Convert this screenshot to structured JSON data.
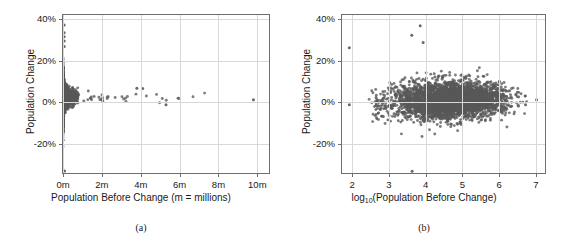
{
  "figure": {
    "panels": [
      {
        "id": "panel-a",
        "caption": "(a)",
        "xlabel": "Population Before Change (m = millions)",
        "ylabel": "Population Change",
        "xticks": [
          "0m",
          "2m",
          "4m",
          "6m",
          "8m",
          "10m"
        ],
        "yticks": [
          "40%",
          "20%",
          "0%",
          "-20%"
        ]
      },
      {
        "id": "panel-b",
        "caption": "(b)",
        "xlabel_prefix": "log",
        "xlabel_sub": "10",
        "xlabel_suffix": "(Population Before Change)",
        "ylabel": "Population Change",
        "xticks": [
          "2",
          "3",
          "4",
          "5",
          "6",
          "7"
        ],
        "yticks": [
          "40%",
          "20%",
          "0%",
          "-20%"
        ]
      }
    ]
  },
  "colors": {
    "point": "#585858",
    "frame": "#6e6e6e",
    "grid": "#d8d8d8",
    "text": "#1a1a1a",
    "background": "#ffffff"
  },
  "chart_data": [
    {
      "type": "scatter",
      "panel": "(a)",
      "title": "",
      "xlabel": "Population Before Change (m = millions)",
      "ylabel": "Population Change",
      "xlim": [
        0,
        10600000
      ],
      "ylim": [
        -0.34,
        0.42
      ],
      "xtick_values": [
        0,
        2000000,
        4000000,
        6000000,
        8000000,
        10000000
      ],
      "xtick_labels": [
        "0m",
        "2m",
        "4m",
        "6m",
        "8m",
        "10m"
      ],
      "ytick_values": [
        0.4,
        0.2,
        0.0,
        -0.2
      ],
      "ytick_labels": [
        "40%",
        "20%",
        "0%",
        "-20%"
      ],
      "grid": true,
      "legend": null,
      "marker": {
        "shape": "circle",
        "color": "#585858",
        "size": 1.6,
        "opacity": 0.8
      },
      "description": "Dense funnel of points hugging x=0; spread in Population Change narrows as population increases. Extreme outliers near x=0 up to +37% and down to -33%. Isolated points near 3.8m, 4.1m (~+7%), 5.3m (~-1%) and 9.8m (~+1%).",
      "n_points": 2800,
      "outliers": [
        {
          "x": 60000,
          "y": 0.372
        },
        {
          "x": 60000,
          "y": 0.335
        },
        {
          "x": 60000,
          "y": 0.315
        },
        {
          "x": 60000,
          "y": 0.295
        },
        {
          "x": 60000,
          "y": 0.268
        },
        {
          "x": 80000,
          "y": -0.33
        },
        {
          "x": 3800000,
          "y": 0.068
        },
        {
          "x": 4100000,
          "y": 0.066
        },
        {
          "x": 5300000,
          "y": -0.012
        },
        {
          "x": 9800000,
          "y": 0.012
        }
      ]
    },
    {
      "type": "scatter",
      "panel": "(b)",
      "title": "",
      "xlabel": "log10(Population Before Change)",
      "ylabel": "Population Change",
      "xlim": [
        1.72,
        7.25
      ],
      "ylim": [
        -0.34,
        0.42
      ],
      "xtick_values": [
        2,
        3,
        4,
        5,
        6,
        7
      ],
      "xtick_labels": [
        "2",
        "3",
        "4",
        "5",
        "6",
        "7"
      ],
      "ytick_values": [
        0.4,
        0.2,
        0.0,
        -0.2
      ],
      "ytick_labels": [
        "40%",
        "20%",
        "0%",
        "-20%"
      ],
      "grid": true,
      "legend": null,
      "marker": {
        "shape": "circle",
        "color": "#585858",
        "size": 1.6,
        "opacity": 0.8
      },
      "description": "Horizontally elongated cloud centered near y=0%, densest between log10 = 3.5 and 6.0; slight upward drift of the upper envelope toward larger populations. Sparse isolated points at log10 ~1.9 (+26% and -1%) and ~7.0 (+1%).",
      "n_points": 2800,
      "outliers": [
        {
          "x": 1.92,
          "y": 0.262
        },
        {
          "x": 1.92,
          "y": -0.012
        },
        {
          "x": 3.85,
          "y": 0.368
        },
        {
          "x": 3.62,
          "y": 0.322
        },
        {
          "x": 3.93,
          "y": 0.288
        },
        {
          "x": 3.63,
          "y": -0.332
        },
        {
          "x": 7.02,
          "y": 0.012
        },
        {
          "x": 6.72,
          "y": -0.012
        }
      ]
    }
  ]
}
